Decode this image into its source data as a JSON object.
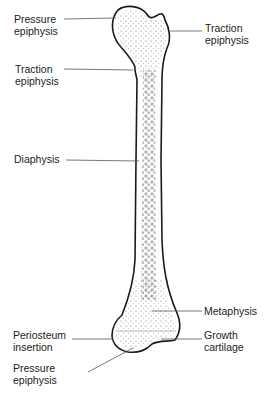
{
  "diagram": {
    "labels": [
      {
        "id": "pressure-epiphysis-top",
        "text": "Pressure\nepiphysis",
        "x": 14,
        "y": 13
      },
      {
        "id": "traction-epiphysis-right",
        "text": "Traction\nepiphysis",
        "x": 205,
        "y": 22
      },
      {
        "id": "traction-epiphysis-left",
        "text": "Traction\nepiphysis",
        "x": 15,
        "y": 63
      },
      {
        "id": "diaphysis",
        "text": "Diaphysis",
        "x": 14,
        "y": 152
      },
      {
        "id": "metaphysis",
        "text": "Metaphysis",
        "x": 204,
        "y": 305
      },
      {
        "id": "periosteum-insertion",
        "text": "Periosteum\ninsertion",
        "x": 13,
        "y": 329
      },
      {
        "id": "growth-cartilage",
        "text": "Growth\ncartilage",
        "x": 204,
        "y": 329
      },
      {
        "id": "pressure-epiphysis-bottom",
        "text": "Pressure\nepiphysis",
        "x": 13,
        "y": 362
      }
    ],
    "colors": {
      "outline": "#1a1a1a",
      "leader": "#555555",
      "stipple": "#444444",
      "text": "#222222"
    }
  }
}
